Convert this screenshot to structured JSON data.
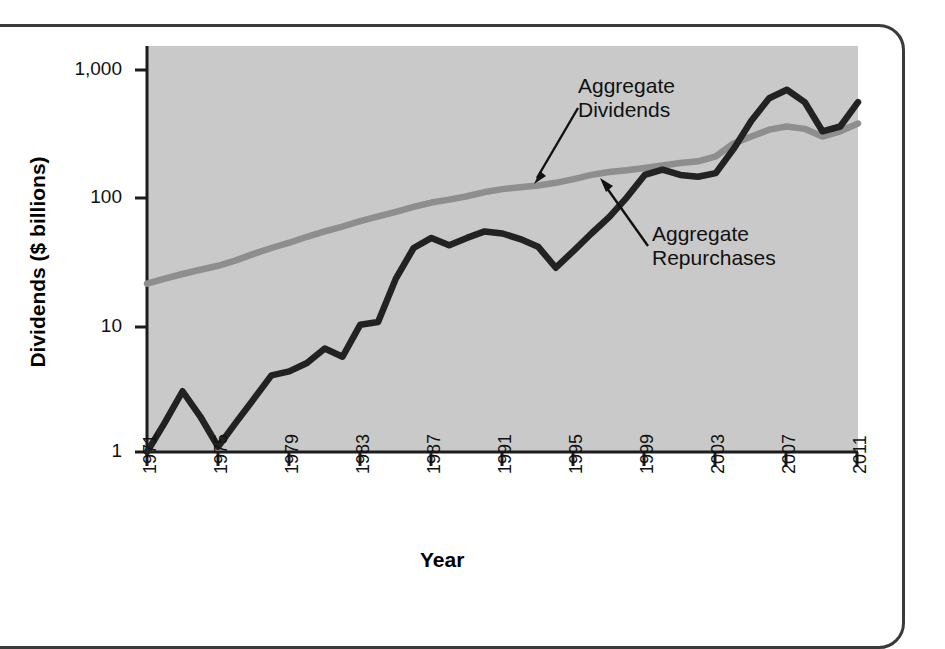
{
  "figure": {
    "frame": "rounded-rect-border",
    "background_color": "#ffffff",
    "plot_background_color": "#c9c9c9"
  },
  "axis_titles": {
    "y": "Dividends ($ billions)",
    "x": "Year"
  },
  "annotations": [
    {
      "id": "dividends",
      "line1": "Aggregate",
      "line2": "Dividends"
    },
    {
      "id": "repurchases",
      "line1": "Aggregate",
      "line2": "Repurchases"
    }
  ],
  "y_ticks": [
    "1,000",
    "100",
    "10",
    "1"
  ],
  "x_ticks": [
    "1971",
    "1975",
    "1979",
    "1983",
    "1987",
    "1991",
    "1995",
    "1999",
    "2003",
    "2007",
    "2011"
  ],
  "colors": {
    "dividends_line": "#8e8e8e",
    "repurchases_line": "#222222",
    "axis": "#1c1c1c",
    "plot_area": "#c9c9c9"
  },
  "chart_data": {
    "type": "line",
    "title": "",
    "subtitle": "",
    "xlabel": "Year",
    "ylabel": "Dividends ($ billions)",
    "yscale": "log",
    "ylim": [
      1,
      1000
    ],
    "xlim": [
      1971,
      2011
    ],
    "grid": false,
    "legend_position": "inline-annotations",
    "y_tick_values": [
      1,
      10,
      100,
      1000
    ],
    "y_tick_labels": [
      "1",
      "10",
      "100",
      "1,000"
    ],
    "x_tick_values": [
      1971,
      1975,
      1979,
      1983,
      1987,
      1991,
      1995,
      1999,
      2003,
      2007,
      2011
    ],
    "x_tick_labels": [
      "1971",
      "1975",
      "1979",
      "1983",
      "1987",
      "1991",
      "1995",
      "1999",
      "2003",
      "2007",
      "2011"
    ],
    "x": [
      1971,
      1972,
      1973,
      1974,
      1975,
      1976,
      1977,
      1978,
      1979,
      1980,
      1981,
      1982,
      1983,
      1984,
      1985,
      1986,
      1987,
      1988,
      1989,
      1990,
      1991,
      1992,
      1993,
      1994,
      1995,
      1996,
      1997,
      1998,
      1999,
      2000,
      2001,
      2002,
      2003,
      2004,
      2005,
      2006,
      2007,
      2008,
      2009,
      2010,
      2011
    ],
    "series": [
      {
        "name": "Aggregate Dividends",
        "color": "#8e8e8e",
        "values": [
          21,
          23,
          25,
          27,
          29,
          32,
          36,
          40,
          44,
          49,
          54,
          59,
          65,
          71,
          77,
          84,
          91,
          96,
          102,
          110,
          116,
          120,
          124,
          130,
          139,
          150,
          158,
          163,
          170,
          178,
          186,
          192,
          210,
          265,
          300,
          340,
          360,
          345,
          300,
          330,
          380
        ]
      },
      {
        "name": "Aggregate Repurchases",
        "color": "#222222",
        "values": [
          1.0,
          1.7,
          3.0,
          1.9,
          1.1,
          1.7,
          2.6,
          4.0,
          4.3,
          5.0,
          6.5,
          5.6,
          10.0,
          10.5,
          23,
          40,
          48,
          42,
          48,
          54,
          52,
          47,
          41,
          28,
          38,
          52,
          70,
          100,
          150,
          165,
          150,
          145,
          155,
          240,
          400,
          600,
          700,
          560,
          330,
          360,
          560
        ]
      }
    ]
  }
}
